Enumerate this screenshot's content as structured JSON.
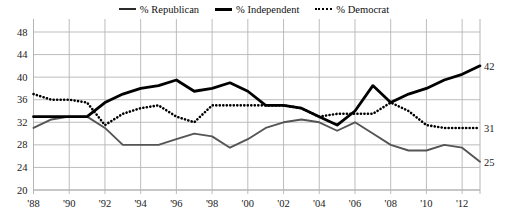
{
  "legend": {
    "position": "top-center",
    "entries": [
      {
        "label": "% Republican",
        "style": "solid-thin",
        "icon": "line-swatch-icon",
        "color": "#2b2b2b"
      },
      {
        "label": "% Independent",
        "style": "solid-thick",
        "icon": "line-swatch-icon",
        "color": "#000000"
      },
      {
        "label": "% Democrat",
        "style": "dotted",
        "icon": "dotted-line-swatch-icon",
        "color": "#000000"
      }
    ]
  },
  "end_labels": {
    "independent": "42",
    "democrat": "31",
    "republican": "25"
  },
  "chart_data": {
    "type": "line",
    "title": "",
    "subtitle": "",
    "xlabel": "",
    "ylabel": "",
    "xlim": [
      1988,
      2013
    ],
    "ylim": [
      20,
      48
    ],
    "ytick_labels": [
      "20",
      "24",
      "28",
      "32",
      "36",
      "40",
      "44",
      "48"
    ],
    "ytick_values": [
      20,
      24,
      28,
      32,
      36,
      40,
      44,
      48
    ],
    "xtick_labels": [
      "'88",
      "'90",
      "'92",
      "'94",
      "'96",
      "'98",
      "'00",
      "'02",
      "'04",
      "'06",
      "'08",
      "'10",
      "'12"
    ],
    "xtick_values": [
      1988,
      1990,
      1992,
      1994,
      1996,
      1998,
      2000,
      2002,
      2004,
      2006,
      2008,
      2010,
      2012
    ],
    "grid": true,
    "grid_color": "#b5b5b5",
    "legend_position": "top-center",
    "x": [
      1988,
      1989,
      1990,
      1991,
      1992,
      1993,
      1994,
      1995,
      1996,
      1997,
      1998,
      1999,
      2000,
      2001,
      2002,
      2003,
      2004,
      2005,
      2006,
      2007,
      2008,
      2009,
      2010,
      2011,
      2012,
      2013
    ],
    "series": [
      {
        "name": "% Republican",
        "style": "solid-thin",
        "color": "#555555",
        "end_label": "25",
        "values": [
          31,
          32.5,
          33,
          33,
          31,
          28,
          28,
          28,
          29,
          30,
          29.5,
          27.5,
          29,
          31,
          32,
          32.5,
          32,
          30.5,
          32,
          30,
          28,
          27,
          27,
          28,
          27.5,
          25
        ]
      },
      {
        "name": "% Independent",
        "style": "solid-thick",
        "color": "#000000",
        "end_label": "42",
        "values": [
          33,
          33,
          33,
          33,
          35.5,
          37,
          38,
          38.5,
          39.5,
          37.5,
          38,
          39,
          37.5,
          35,
          35,
          34.5,
          33,
          31.5,
          34,
          38.5,
          35.5,
          37,
          38,
          39.5,
          40.5,
          42
        ]
      },
      {
        "name": "% Democrat",
        "style": "dotted",
        "color": "#000000",
        "end_label": "31",
        "values": [
          37,
          36,
          36,
          35.5,
          31.5,
          33.5,
          34.5,
          35,
          33,
          32,
          35,
          35,
          35,
          35,
          35,
          34.5,
          33,
          33.5,
          33.5,
          33.5,
          35.5,
          34,
          31.5,
          31,
          31,
          31
        ]
      }
    ]
  }
}
